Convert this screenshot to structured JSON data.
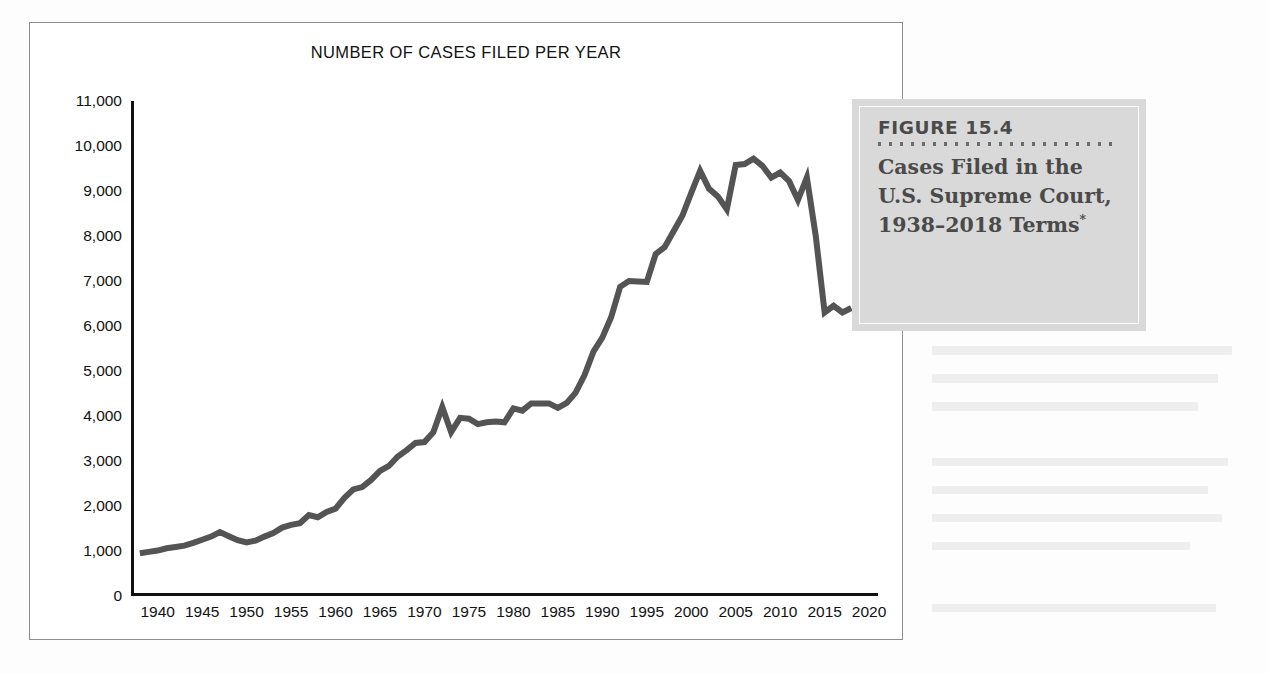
{
  "figure": {
    "number_label": "FIGURE 15.4",
    "caption_title": "Cases Filed in the U.S. Supreme Court, 1938–2018",
    "caption_title_tail": "Terms",
    "caption_footnote_marker": "*",
    "dot_count": 22,
    "box_color": "#d9d9d9",
    "caption_text_color": "#4a4a4a"
  },
  "chart_data": {
    "type": "line",
    "title": "NUMBER OF CASES FILED PER YEAR",
    "xlabel": "",
    "ylabel": "",
    "xlim": [
      1937,
      2021
    ],
    "ylim": [
      0,
      11000
    ],
    "grid": false,
    "legend": null,
    "line_color": "#545454",
    "line_width": 6,
    "y_ticks": [
      0,
      1000,
      2000,
      3000,
      4000,
      5000,
      6000,
      7000,
      8000,
      9000,
      10000,
      11000
    ],
    "y_tick_labels": [
      "0",
      "1,000",
      "2,000",
      "3,000",
      "4,000",
      "5,000",
      "6,000",
      "7,000",
      "8,000",
      "9,000",
      "10,000",
      "11,000"
    ],
    "x_ticks": [
      1940,
      1945,
      1950,
      1955,
      1960,
      1965,
      1970,
      1975,
      1980,
      1985,
      1990,
      1995,
      2000,
      2005,
      2010,
      2015,
      2020
    ],
    "x_tick_labels": [
      "1940",
      "1945",
      "1950",
      "1955",
      "1960",
      "1965",
      "1970",
      "1975",
      "1980",
      "1985",
      "1990",
      "1995",
      "2000",
      "2005",
      "2010",
      "2015",
      "2020"
    ],
    "x": [
      1938,
      1939,
      1940,
      1941,
      1942,
      1943,
      1944,
      1945,
      1946,
      1947,
      1948,
      1949,
      1950,
      1951,
      1952,
      1953,
      1954,
      1955,
      1956,
      1957,
      1958,
      1959,
      1960,
      1961,
      1962,
      1963,
      1964,
      1965,
      1966,
      1967,
      1968,
      1969,
      1970,
      1971,
      1972,
      1973,
      1974,
      1975,
      1976,
      1977,
      1978,
      1979,
      1980,
      1981,
      1982,
      1983,
      1984,
      1985,
      1986,
      1987,
      1988,
      1989,
      1990,
      1991,
      1992,
      1993,
      1994,
      1995,
      1996,
      1997,
      1998,
      1999,
      2000,
      2001,
      2002,
      2003,
      2004,
      2005,
      2006,
      2007,
      2008,
      2009,
      2010,
      2011,
      2012,
      2013,
      2014,
      2015,
      2016,
      2017,
      2018
    ],
    "values": [
      950,
      980,
      1010,
      1060,
      1090,
      1120,
      1180,
      1250,
      1320,
      1420,
      1330,
      1240,
      1190,
      1230,
      1320,
      1400,
      1520,
      1580,
      1620,
      1800,
      1750,
      1870,
      1940,
      2180,
      2370,
      2420,
      2580,
      2780,
      2890,
      3100,
      3240,
      3400,
      3420,
      3640,
      4200,
      3640,
      3960,
      3940,
      3820,
      3860,
      3880,
      3860,
      4170,
      4120,
      4280,
      4280,
      4280,
      4180,
      4290,
      4520,
      4910,
      5430,
      5740,
      6200,
      6870,
      7000,
      6990,
      6980,
      7600,
      7750,
      8100,
      8450,
      8960,
      9450,
      9050,
      8880,
      8590,
      9580,
      9600,
      9720,
      9560,
      9300,
      9410,
      9220,
      8800,
      9300,
      8000,
      6300,
      6450,
      6300,
      6400
    ]
  }
}
